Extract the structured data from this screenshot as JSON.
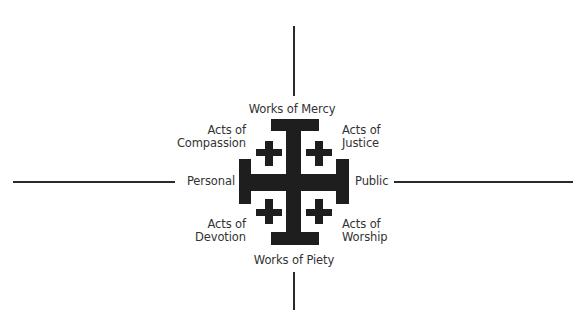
{
  "diagram": {
    "colors": {
      "cross": "#1e1e1e",
      "axis_lines": "#2a2a2a",
      "text": "#333333",
      "background": "#ffffff"
    },
    "axes": {
      "left": "Personal",
      "right": "Public",
      "top": "Works of Mercy",
      "bottom": "Works of Piety"
    },
    "quadrants": {
      "top_left": {
        "line1": "Acts of",
        "line2": "Compassion"
      },
      "top_right": {
        "line1": "Acts of",
        "line2": "Justice"
      },
      "bottom_left": {
        "line1": "Acts of",
        "line2": "Devotion"
      },
      "bottom_right": {
        "line1": "Acts of",
        "line2": "Worship"
      }
    },
    "center_symbol": "jerusalem-cross"
  }
}
